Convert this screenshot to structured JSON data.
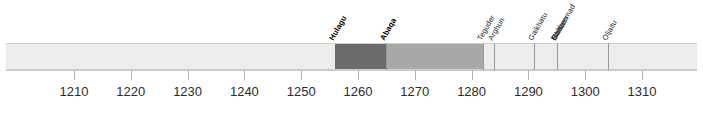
{
  "chart_data": {
    "type": "bar",
    "title": "",
    "xlabel": "",
    "ylabel": "",
    "orientation": "horizontal-timeline",
    "grid": false,
    "legend": "none",
    "xlim": [
      1203,
      1316
    ],
    "axis": {
      "ticks": [
        1210,
        1220,
        1230,
        1240,
        1250,
        1260,
        1270,
        1280,
        1290,
        1300,
        1310
      ],
      "tick_labels": [
        "1210",
        "1220",
        "1230",
        "1240",
        "1250",
        "1260",
        "1270",
        "1280",
        "1290",
        "1300",
        "1310"
      ],
      "tick_interval": 10
    },
    "rulers": [
      {
        "name": "Hulagu",
        "start": 1256,
        "end": 1265,
        "color": "#6b6b6b",
        "emphasis": "bold"
      },
      {
        "name": "Abaqa",
        "start": 1265,
        "end": 1282,
        "color": "#a8a8a8",
        "emphasis": "bold"
      },
      {
        "name": "Teguder",
        "start": 1282,
        "end": 1284,
        "color": "#ececec",
        "emphasis": "normal"
      },
      {
        "name": "Arghun",
        "start": 1284,
        "end": 1291,
        "color": "#ececec",
        "emphasis": "normal"
      },
      {
        "name": "Gaikhatu",
        "start": 1291,
        "end": 1295,
        "color": "#ececec",
        "emphasis": "normal"
      },
      {
        "name": "Baidu",
        "start": 1295,
        "end": 1295,
        "color": "#ececec",
        "emphasis": "normal"
      },
      {
        "name": "Muhammad",
        "start": 1295,
        "end": 1295,
        "color": "#ececec",
        "emphasis": "normal"
      },
      {
        "name": "Ghazan",
        "start": 1295,
        "end": 1304,
        "color": "#ececec",
        "emphasis": "normal"
      },
      {
        "name": "Oljaitu",
        "start": 1304,
        "end": 1316,
        "color": "#ececec",
        "emphasis": "normal"
      }
    ],
    "labels": [
      "Hulagu",
      "Abaqa",
      "Teguder",
      "Arghun",
      "Gaikhatu",
      "Baidu",
      "Muhammad",
      "Ghazan",
      "Oljaitu"
    ]
  },
  "colors": {
    "bar_base": "#ececec",
    "segment_dark": "#6b6b6b",
    "segment_medium": "#a8a8a8",
    "divider": "#9a9a9a",
    "axis": "#c8c8c8",
    "text": "#1a1a1a",
    "background": "#ffffff"
  },
  "geometry": {
    "bar_left_px": 6,
    "bar_right_px": 697,
    "bar_top_px": 43,
    "bar_height_px": 27,
    "px_per_decade": 56.8,
    "tick_1210_x_px": 74
  }
}
